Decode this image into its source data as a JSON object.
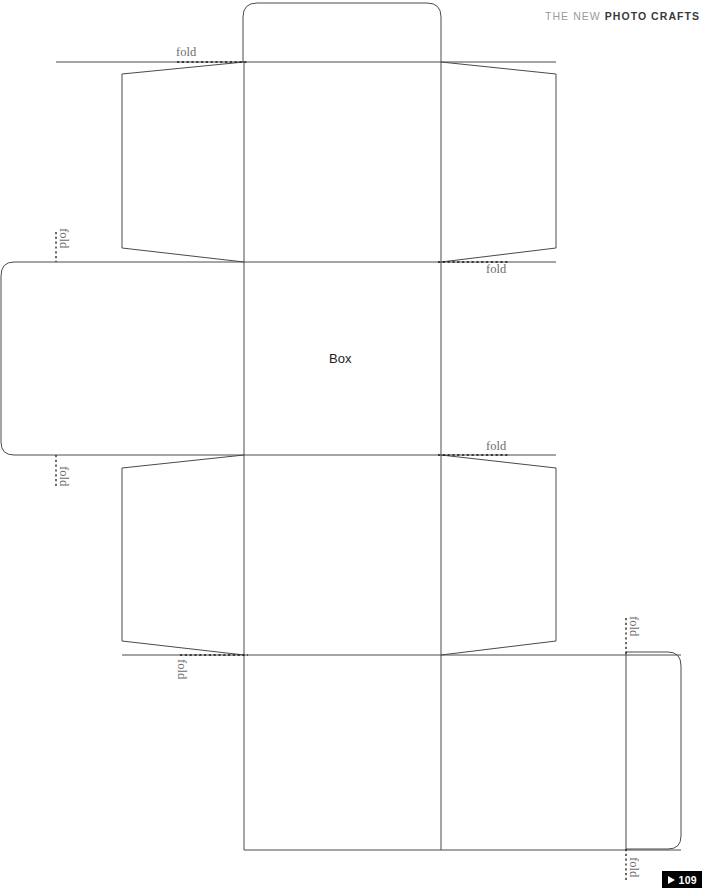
{
  "header": {
    "light_text": "THE NEW",
    "bold_text": "PHOTO CRAFTS",
    "color_light": "#9b9b9b",
    "color_bold": "#3a3a3a"
  },
  "template": {
    "name": "Box",
    "center_label": "Box",
    "line_color": "#4a4a4a",
    "fold_line_color": "#1a1a1a",
    "background": "#ffffff"
  },
  "fold_labels": [
    {
      "id": "fold-top-left",
      "text": "fold",
      "x": 176,
      "y": 46,
      "orientation": "horizontal"
    },
    {
      "id": "fold-upper-right",
      "text": "fold",
      "x": 486,
      "y": 263,
      "orientation": "horizontal"
    },
    {
      "id": "fold-mid-right",
      "text": "fold",
      "x": 486,
      "y": 440,
      "orientation": "horizontal"
    },
    {
      "id": "fold-left-upper-vert",
      "text": "fold",
      "x": 63,
      "y": 228,
      "orientation": "vertical"
    },
    {
      "id": "fold-left-lower-vert",
      "text": "fold",
      "x": 63,
      "y": 466,
      "orientation": "vertical"
    },
    {
      "id": "fold-bottom-left",
      "text": "fold",
      "x": 181,
      "y": 659,
      "orientation": "vertical"
    },
    {
      "id": "fold-right-upper-vert",
      "text": "fold",
      "x": 633,
      "y": 616,
      "orientation": "vertical"
    },
    {
      "id": "fold-right-lower-vert",
      "text": "fold",
      "x": 633,
      "y": 857,
      "orientation": "vertical"
    }
  ],
  "page_badge": {
    "number": "109",
    "icon": "play-triangle-icon",
    "background": "#000000",
    "color": "#ffffff"
  }
}
